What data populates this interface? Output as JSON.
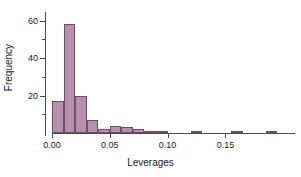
{
  "chart_data": {
    "type": "bar",
    "title": "",
    "subtitle": "",
    "xlabel": "Leverages",
    "ylabel": "Frequency",
    "grid": false,
    "legend": null,
    "xlim": [
      0.0,
      0.205
    ],
    "ylim": [
      0,
      63
    ],
    "bin_width": 0.01,
    "x_ticks": [
      "0.00",
      "0.05",
      "0.10",
      "0.15"
    ],
    "x_tick_values": [
      0.0,
      0.05,
      0.1,
      0.15
    ],
    "y_ticks": [
      "20",
      "40",
      "60"
    ],
    "y_tick_values": [
      20,
      40,
      60
    ],
    "y_minor_ticks": [
      10,
      30,
      50
    ],
    "bin_starts": [
      0.0,
      0.01,
      0.02,
      0.03,
      0.04,
      0.05,
      0.06,
      0.07,
      0.08,
      0.09,
      0.12,
      0.155,
      0.185
    ],
    "bin_ends": [
      0.01,
      0.02,
      0.03,
      0.04,
      0.05,
      0.06,
      0.07,
      0.08,
      0.09,
      0.1,
      0.13,
      0.165,
      0.195
    ],
    "categories": [
      "0.00-0.01",
      "0.01-0.02",
      "0.02-0.03",
      "0.03-0.04",
      "0.04-0.05",
      "0.05-0.06",
      "0.06-0.07",
      "0.07-0.08",
      "0.08-0.09",
      "0.09-0.10",
      "0.12-0.13",
      "0.155-0.165",
      "0.185-0.195"
    ],
    "values": [
      17,
      58,
      20,
      7,
      2,
      4,
      3,
      2,
      1,
      1,
      1,
      1,
      1
    ],
    "bar_fill_color": "#b98fae",
    "bar_border_color": "#6e4f68",
    "axis_color": "#4a4a4a",
    "background_color": "#ffffff"
  }
}
